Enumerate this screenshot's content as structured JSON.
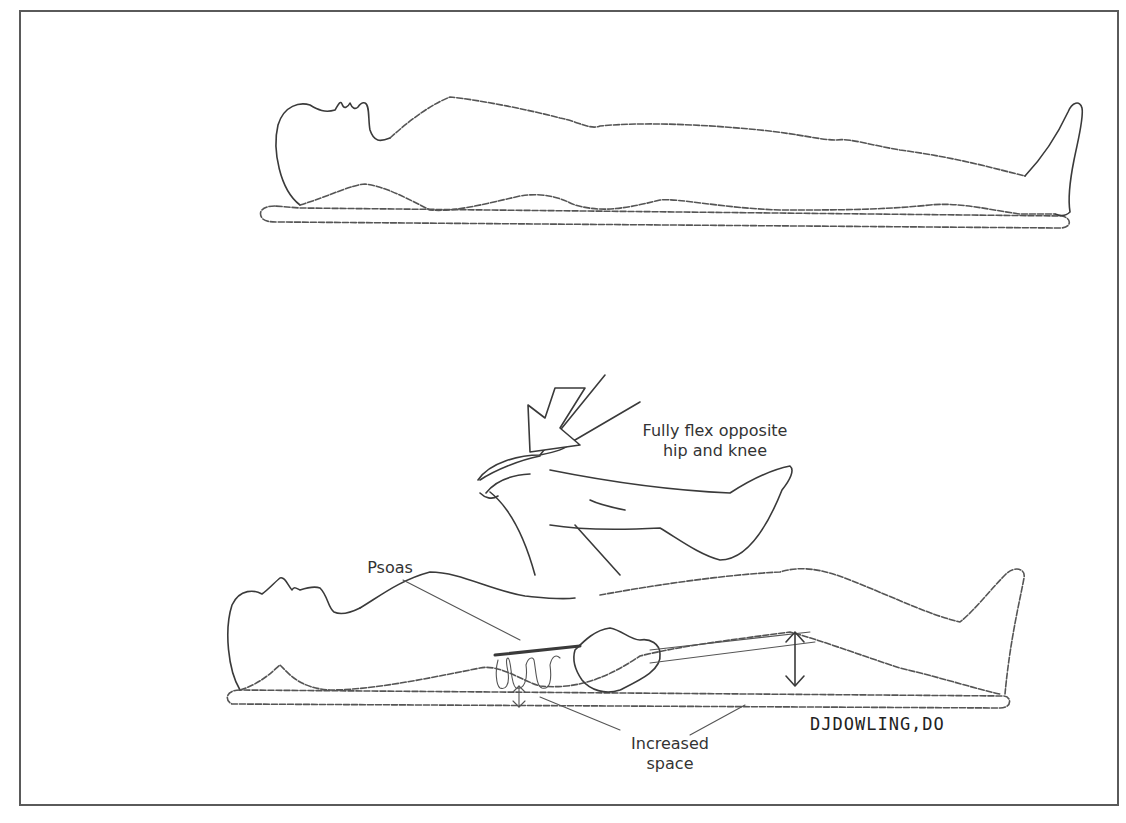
{
  "figure": {
    "top_panel": {
      "description": "Patient lying supine on table"
    },
    "bottom_panel": {
      "description": "Patient supine; opposite hip and knee fully flexed by examiner's hand; psoas and lumbar spine shown",
      "labels": {
        "instruction": [
          "Fully flex opposite",
          "hip and knee"
        ],
        "muscle": "Psoas",
        "result": [
          "Increased",
          "space"
        ]
      },
      "signature": "DJDOWLING,DO"
    }
  },
  "colors": {
    "line": "#3a3a3a",
    "frame": "#5a5a5a",
    "text": "#333333",
    "background": "#ffffff"
  }
}
